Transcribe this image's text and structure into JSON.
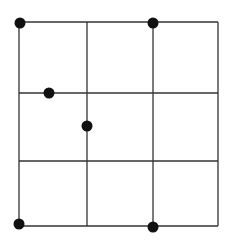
{
  "diagram": {
    "type": "grid-with-points",
    "grid": {
      "rows": 3,
      "cols": 3,
      "x_lines": [
        19,
        87,
        153,
        218
      ],
      "y_lines": [
        22,
        93,
        161,
        226
      ],
      "line_color": "#333333",
      "line_width": 1.3
    },
    "points": [
      {
        "x": 20,
        "y": 23,
        "r": 5.5
      },
      {
        "x": 153,
        "y": 23,
        "r": 5.5
      },
      {
        "x": 49,
        "y": 93,
        "r": 5.5
      },
      {
        "x": 87,
        "y": 126,
        "r": 5.5
      },
      {
        "x": 19,
        "y": 224,
        "r": 5.5
      },
      {
        "x": 153,
        "y": 227,
        "r": 5.5
      }
    ],
    "point_color": "#111111"
  }
}
